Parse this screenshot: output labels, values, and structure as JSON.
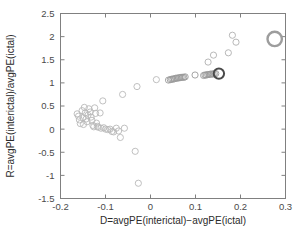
{
  "chart_data": {
    "type": "scatter",
    "title": "",
    "xlabel": "D=avgPE(interictal)−avgPE(ictal)",
    "ylabel": "R=avgPE(interictal)/avgPE(ictal)",
    "xlim": [
      -0.2,
      0.3
    ],
    "ylim": [
      -1.5,
      2.5
    ],
    "xticks": [
      -0.2,
      -0.1,
      0,
      0.1,
      0.2,
      0.3
    ],
    "xticklabels": [
      "-0.2",
      "-0.1",
      "0",
      "0.1",
      "0.2",
      "0.3"
    ],
    "yticks": [
      -1.5,
      -1,
      -0.5,
      0,
      0.5,
      1,
      1.5,
      2,
      2.5
    ],
    "yticklabels": [
      "-1.5",
      "-1",
      "-0.5",
      "0",
      "0.5",
      "1",
      "1.5",
      "2",
      "2.5"
    ],
    "grid": false,
    "legend": null,
    "marker_shape": "circle-open",
    "series": [
      {
        "name": "interictal-cluster",
        "color": "#b9b9b9",
        "marker_size": 3.1,
        "stroke_width": 0.9,
        "points": [
          [
            -0.163,
            0.33
          ],
          [
            -0.16,
            0.28
          ],
          [
            -0.158,
            0.2
          ],
          [
            -0.156,
            0.12
          ],
          [
            -0.152,
            0.4
          ],
          [
            -0.15,
            0.25
          ],
          [
            -0.149,
            0.1
          ],
          [
            -0.147,
            0.47
          ],
          [
            -0.145,
            0.35
          ],
          [
            -0.143,
            0.22
          ],
          [
            -0.141,
            0.16
          ],
          [
            -0.139,
            0.3
          ],
          [
            -0.137,
            0.44
          ],
          [
            -0.134,
            0.37
          ],
          [
            -0.132,
            0.26
          ],
          [
            -0.13,
            0.19
          ],
          [
            -0.128,
            0.08
          ],
          [
            -0.126,
            0.05
          ],
          [
            -0.124,
            0.46
          ],
          [
            -0.122,
            0.34
          ],
          [
            -0.12,
            0.13
          ],
          [
            -0.118,
            0.06
          ],
          [
            -0.116,
            0.04
          ],
          [
            -0.112,
            0.35
          ],
          [
            -0.11,
            0.02
          ],
          [
            -0.106,
            0.61
          ],
          [
            -0.104,
            0.03
          ],
          [
            -0.1,
            0.0
          ],
          [
            -0.095,
            -0.01
          ],
          [
            -0.09,
            0.0
          ],
          [
            -0.086,
            -0.05
          ],
          [
            -0.082,
            -0.06
          ],
          [
            -0.076,
            0.02
          ],
          [
            -0.071,
            -0.04
          ],
          [
            -0.067,
            -0.18
          ],
          [
            -0.062,
            0.75
          ],
          [
            -0.058,
            0.02
          ],
          [
            -0.034,
            -0.48
          ],
          [
            -0.03,
            0.92
          ],
          [
            -0.027,
            -1.17
          ],
          [
            0.013,
            1.07
          ]
        ]
      },
      {
        "name": "transition-chain",
        "color": "#9a9a9a",
        "marker_size": 3.1,
        "stroke_width": 0.9,
        "points": [
          [
            0.04,
            1.06
          ],
          [
            0.044,
            1.07
          ],
          [
            0.047,
            1.08
          ],
          [
            0.05,
            1.08
          ],
          [
            0.053,
            1.09
          ],
          [
            0.056,
            1.1
          ],
          [
            0.059,
            1.1
          ],
          [
            0.062,
            1.11
          ],
          [
            0.065,
            1.11
          ],
          [
            0.068,
            1.12
          ],
          [
            0.071,
            1.12
          ],
          [
            0.074,
            1.12
          ],
          [
            0.077,
            1.13
          ],
          [
            0.099,
            1.17
          ],
          [
            0.118,
            1.16
          ],
          [
            0.121,
            1.17
          ],
          [
            0.124,
            1.17
          ],
          [
            0.127,
            1.18
          ],
          [
            0.13,
            1.18
          ],
          [
            0.133,
            1.19
          ],
          [
            0.136,
            1.19
          ],
          [
            0.139,
            1.19
          ],
          [
            0.142,
            1.2
          ],
          [
            0.145,
            1.2
          ]
        ]
      },
      {
        "name": "upper-right-outliers",
        "color": "#b0b0b0",
        "marker_size": 3.1,
        "stroke_width": 0.9,
        "points": [
          [
            0.128,
            1.45
          ],
          [
            0.14,
            1.6
          ],
          [
            0.173,
            1.65
          ],
          [
            0.182,
            2.03
          ],
          [
            0.19,
            1.88
          ]
        ]
      },
      {
        "name": "highlighted-ictal-marker",
        "color": "#4a4a4a",
        "marker_size": 5.2,
        "stroke_width": 2.0,
        "points": [
          [
            0.152,
            1.2
          ]
        ]
      },
      {
        "name": "highlighted-extreme-marker",
        "color": "#9d9d9d",
        "marker_size": 7.2,
        "stroke_width": 2.4,
        "points": [
          [
            0.276,
            1.95
          ]
        ]
      }
    ]
  },
  "figure": {
    "background": "#ffffff",
    "axis_color": "#808080",
    "text_color": "#2b2b2b"
  }
}
